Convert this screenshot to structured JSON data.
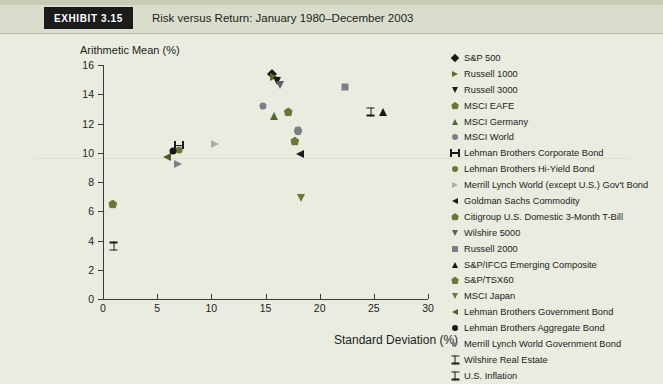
{
  "header": {
    "exhibit_label": "Exhibit 3.15",
    "title": "Risk versus Return: January 1980–December 2003"
  },
  "colors": {
    "page_background": "#e9ecdf",
    "header_band": "#d9ddcb",
    "exhibit_tag_bg": "#1b1b1b",
    "exhibit_tag_text": "#ffffff",
    "axis": "#3a3a3a",
    "text": "#1d1d1d",
    "black_marker": "#1a1a1a",
    "olive_marker": "#6f7437",
    "green_marker": "#4e6b33",
    "gray_marker": "#7b8088",
    "light_gray_marker": "#a8aeb0",
    "dark_gray_marker": "#5a6068"
  },
  "chart_data": {
    "type": "scatter",
    "title": "Risk versus Return: January 1980–December 2003",
    "xlabel": "Standard Deviation (%)",
    "ylabel": "Arithmetic Mean (%)",
    "xlim": [
      0,
      30
    ],
    "ylim": [
      0,
      16
    ],
    "xticks": [
      0,
      5,
      10,
      15,
      20,
      25,
      30
    ],
    "xtick_labels": [
      "0",
      "5",
      "10",
      "15",
      "20",
      "25",
      "30"
    ],
    "yticks": [
      0,
      2,
      4,
      6,
      8,
      10,
      12,
      14,
      16
    ],
    "ytick_labels": [
      "0",
      "2",
      "4",
      "6",
      "8",
      "10",
      "12",
      "14",
      "16"
    ],
    "grid": false,
    "legend_position": "right",
    "points": [
      {
        "name": "S&P 500",
        "x": 15.6,
        "y": 15.4,
        "symbol": "diamond",
        "color": "#1a1a1a"
      },
      {
        "name": "Russell 1000",
        "x": 15.8,
        "y": 15.2,
        "symbol": "triangle-right",
        "color": "#5f6b2e"
      },
      {
        "name": "Russell 3000",
        "x": 16.1,
        "y": 14.9,
        "symbol": "triangle-down",
        "color": "#1a1a1a"
      },
      {
        "name": "MSCI EAFE",
        "x": 17.1,
        "y": 12.8,
        "symbol": "pentagon",
        "color": "#6f7437"
      },
      {
        "name": "MSCI Germany",
        "x": 15.8,
        "y": 12.5,
        "symbol": "triangle-up",
        "color": "#4e6b33"
      },
      {
        "name": "MSCI World",
        "x": 14.8,
        "y": 13.2,
        "symbol": "circle",
        "color": "#7b8088"
      },
      {
        "name": "Lehman Brothers Corporate Bond",
        "x": 7.0,
        "y": 10.5,
        "symbol": "h-beam",
        "color": "#1a1a1a"
      },
      {
        "name": "Lehman Brothers Hi-Yield Bond",
        "x": 7.0,
        "y": 10.2,
        "symbol": "circle",
        "color": "#6f7437"
      },
      {
        "name": "Merrill Lynch World (except U.S.) Gov't Bond",
        "x": 10.3,
        "y": 10.6,
        "symbol": "triangle-right",
        "color": "#a8aeb0"
      },
      {
        "name": "Goldman Sachs Commodity",
        "x": 18.2,
        "y": 9.9,
        "symbol": "triangle-left",
        "color": "#1a1a1a"
      },
      {
        "name": "Citigroup U.S. Domestic 3-Month T-Bill",
        "x": 0.9,
        "y": 6.5,
        "symbol": "pentagon",
        "color": "#6f7437"
      },
      {
        "name": "Wilshire 5000",
        "x": 16.3,
        "y": 14.6,
        "symbol": "triangle-down",
        "color": "#5a6068"
      },
      {
        "name": "Russell 2000",
        "x": 22.3,
        "y": 14.5,
        "symbol": "square",
        "color": "#7b8088"
      },
      {
        "name": "S&P/IFCG Emerging Composite",
        "x": 25.8,
        "y": 12.8,
        "symbol": "triangle-up",
        "color": "#1a1a1a"
      },
      {
        "name": "S&P/TSX60",
        "x": 17.7,
        "y": 10.8,
        "symbol": "pentagon",
        "color": "#6f7437"
      },
      {
        "name": "MSCI Japan",
        "x": 18.3,
        "y": 6.9,
        "symbol": "triangle-down",
        "color": "#6f7437"
      },
      {
        "name": "Lehman Brothers Government Bond",
        "x": 5.9,
        "y": 9.7,
        "symbol": "triangle-left",
        "color": "#4e5a28"
      },
      {
        "name": "Lehman Brothers Aggregate Bond",
        "x": 6.5,
        "y": 10.1,
        "symbol": "circle",
        "color": "#1a1a1a"
      },
      {
        "name": "Merrill Lynch World Government Bond",
        "x": 6.9,
        "y": 9.2,
        "symbol": "triangle-right",
        "color": "#7b8088"
      },
      {
        "name": "Wilshire Real Estate",
        "x": 24.7,
        "y": 12.8,
        "symbol": "i-beam",
        "color": "#1a1a1a"
      },
      {
        "name": "U.S. Inflation",
        "x": 1.0,
        "y": 3.6,
        "symbol": "i-beam",
        "color": "#1a1a1a"
      },
      {
        "name": "Russell 2000 cluster",
        "x": 18.0,
        "y": 11.5,
        "symbol": "hexagon",
        "color": "#7b8088"
      }
    ],
    "legend": [
      {
        "label": "S&P 500",
        "symbol": "diamond",
        "color": "#1a1a1a"
      },
      {
        "label": "Russell 1000",
        "symbol": "triangle-right",
        "color": "#5f6b2e"
      },
      {
        "label": "Russell 3000",
        "symbol": "triangle-down",
        "color": "#1a1a1a"
      },
      {
        "label": "MSCI EAFE",
        "symbol": "pentagon",
        "color": "#6f7437"
      },
      {
        "label": "MSCI Germany",
        "symbol": "triangle-up",
        "color": "#4e6b33"
      },
      {
        "label": "MSCI World",
        "symbol": "circle",
        "color": "#7b8088"
      },
      {
        "label": "Lehman Brothers Corporate Bond",
        "symbol": "h-beam",
        "color": "#1a1a1a"
      },
      {
        "label": "Lehman Brothers Hi-Yield Bond",
        "symbol": "circle",
        "color": "#6f7437"
      },
      {
        "label": "Merrill Lynch World (except U.S.) Gov't Bond",
        "symbol": "triangle-right",
        "color": "#a8aeb0"
      },
      {
        "label": "Goldman Sachs Commodity",
        "symbol": "triangle-left",
        "color": "#1a1a1a"
      },
      {
        "label": "Citigroup U.S. Domestic 3-Month T-Bill",
        "symbol": "pentagon",
        "color": "#6f7437"
      },
      {
        "label": "Wilshire 5000",
        "symbol": "triangle-down",
        "color": "#5a6068"
      },
      {
        "label": "Russell 2000",
        "symbol": "square",
        "color": "#7b8088"
      },
      {
        "label": "S&P/IFCG Emerging Composite",
        "symbol": "triangle-up",
        "color": "#1a1a1a"
      },
      {
        "label": "S&P/TSX60",
        "symbol": "pentagon",
        "color": "#6f7437"
      },
      {
        "label": "MSCI Japan",
        "symbol": "triangle-down",
        "color": "#6f7437"
      },
      {
        "label": "Lehman Brothers Government Bond",
        "symbol": "triangle-left",
        "color": "#4e5a28"
      },
      {
        "label": "Lehman Brothers Aggregate Bond",
        "symbol": "circle",
        "color": "#1a1a1a"
      },
      {
        "label": "Merrill Lynch World Government Bond",
        "symbol": "triangle-right",
        "color": "#7b8088"
      },
      {
        "label": "Wilshire Real Estate",
        "symbol": "i-beam",
        "color": "#1a1a1a"
      },
      {
        "label": "U.S. Inflation",
        "symbol": "i-beam",
        "color": "#1a1a1a"
      }
    ]
  }
}
